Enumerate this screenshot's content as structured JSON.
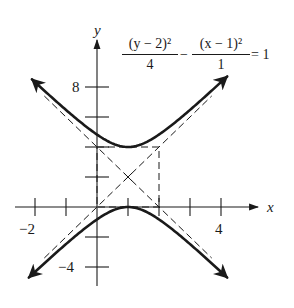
{
  "figure": {
    "equation": {
      "term1": {
        "numerator": "(y − 2)²",
        "denominator": "4"
      },
      "operator": "−",
      "term2": {
        "numerator": "(x − 1)²",
        "denominator": "1"
      },
      "rhs": "= 1"
    },
    "axes": {
      "x_label": "x",
      "y_label": "y",
      "x_tick_labels": [
        {
          "value": -2,
          "text": "−2"
        },
        {
          "value": 4,
          "text": "4"
        }
      ],
      "y_tick_labels": [
        {
          "value": 8,
          "text": "8"
        },
        {
          "value": -4,
          "text": "−4"
        }
      ],
      "x_ticks": [
        -2,
        -1,
        1,
        2,
        3,
        4
      ],
      "y_ticks": [
        -4,
        -2,
        2,
        4,
        6,
        8
      ],
      "x_range": [
        -2.5,
        5.5
      ],
      "y_range": [
        -5.2,
        11.5
      ]
    },
    "hyperbola": {
      "center": [
        1,
        2
      ],
      "a": 2,
      "b": 1,
      "orientation": "vertical",
      "vertices": [
        [
          1,
          4
        ],
        [
          1,
          0
        ]
      ],
      "asymptotes": [
        "y = 2x",
        "y = 4 − 2x"
      ],
      "fundamental_rectangle": {
        "x": [
          0,
          2
        ],
        "y": [
          0,
          4
        ]
      }
    },
    "colors": {
      "ink": "#1a1a1a",
      "background": "#ffffff"
    }
  }
}
